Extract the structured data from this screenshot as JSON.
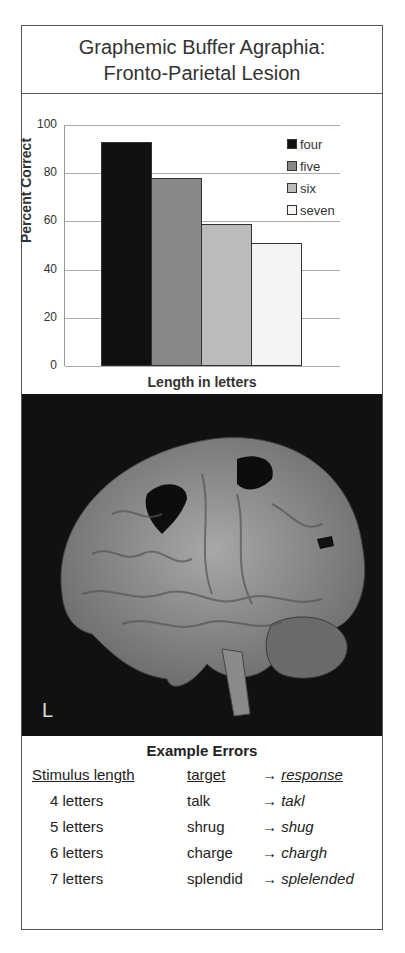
{
  "title": {
    "line1": "Graphemic Buffer Agraphia:",
    "line2": "Fronto-Parietal Lesion"
  },
  "chart_data": {
    "type": "bar",
    "title": "",
    "xlabel": "Length in letters",
    "ylabel": "Percent Correct",
    "ylim": [
      0,
      100
    ],
    "yticks": [
      "0",
      "20",
      "40",
      "60",
      "80",
      "100"
    ],
    "categories": [
      "four",
      "five",
      "six",
      "seven"
    ],
    "values": [
      93,
      78,
      59,
      51
    ],
    "colors": [
      "#111111",
      "#888888",
      "#bbbbbb",
      "#f4f4f4"
    ],
    "legend_position": "upper right",
    "grid": true
  },
  "brain": {
    "hemisphere_label": "L"
  },
  "errors": {
    "title": "Example Errors",
    "header": {
      "length": "Stimulus length",
      "target": "target",
      "arrow": "→",
      "response": "response"
    },
    "rows": [
      {
        "length": "4 letters",
        "target": "talk",
        "response": "takl"
      },
      {
        "length": "5 letters",
        "target": "shrug",
        "response": "shug"
      },
      {
        "length": "6 letters",
        "target": "charge",
        "response": "chargh"
      },
      {
        "length": "7 letters",
        "target": "splendid",
        "response": "splelended"
      }
    ]
  }
}
